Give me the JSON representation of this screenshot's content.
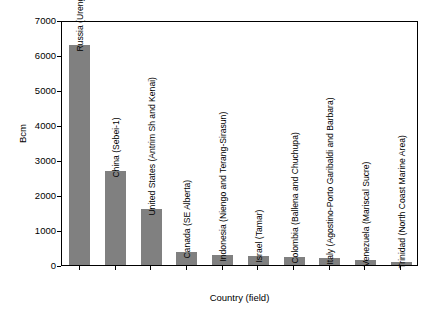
{
  "chart_data": {
    "type": "bar",
    "title": "",
    "subtitle": "",
    "xlabel": "Country (field)",
    "ylabel": "Bcm",
    "ylim": [
      0,
      7000
    ],
    "yticks": [
      0,
      1000,
      2000,
      3000,
      4000,
      5000,
      6000,
      7000
    ],
    "ytick_labels": [
      "0",
      "1000",
      "2000",
      "3000",
      "4000",
      "5000",
      "6000",
      "7000"
    ],
    "grid": false,
    "legend": null,
    "bar_color": "#808080",
    "frame_color": "#000000",
    "categories": [
      "Russia (Urengoy)",
      "China (Sebei-1)",
      "United States (Antrim Sh and Kenai)",
      "Canada (SE Alberta)",
      "Indonesia (Niengo and Terang-Sirasun)",
      "Israel (Tamar)",
      "Colombia (Ballena and Chuchupa)",
      "Italy (Agostino-Porto Garibaldi and Barbara)",
      "Venezuela (Mariscal Sucre)",
      "Trinidad (North Coast Marine Area)"
    ],
    "values": [
      6300,
      2700,
      1600,
      370,
      280,
      250,
      230,
      190,
      130,
      90
    ]
  }
}
